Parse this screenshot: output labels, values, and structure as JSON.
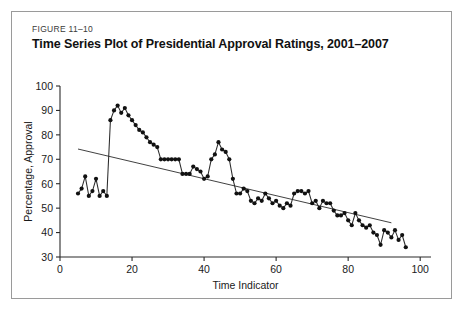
{
  "figure": {
    "number": "FIGURE 11–10",
    "title": "Time Series Plot of Presidential Approval Ratings, 2001–2007",
    "border_color": "#9a9a9a",
    "background_color": "#ffffff"
  },
  "chart_data": {
    "type": "line",
    "title": "Time Series Plot of Presidential Approval Ratings, 2001–2007",
    "xlabel": "Time Indicator",
    "ylabel": "Percentage, Approval",
    "xlim": [
      0,
      103
    ],
    "ylim": [
      30,
      100
    ],
    "xticks": [
      0,
      20,
      40,
      60,
      80,
      100
    ],
    "yticks": [
      30,
      40,
      50,
      60,
      70,
      80,
      90,
      100
    ],
    "grid": false,
    "legend": null,
    "marker": "filled-circle",
    "series": [
      {
        "name": "Presidential Approval Rating",
        "x": [
          5,
          6,
          7,
          8,
          9,
          10,
          11,
          12,
          13,
          14,
          15,
          16,
          17,
          18,
          19,
          20,
          21,
          22,
          23,
          24,
          25,
          26,
          27,
          28,
          29,
          30,
          31,
          32,
          33,
          34,
          35,
          36,
          37,
          38,
          39,
          40,
          41,
          42,
          43,
          44,
          45,
          46,
          47,
          48,
          49,
          50,
          51,
          52,
          53,
          54,
          55,
          56,
          57,
          58,
          59,
          60,
          61,
          62,
          63,
          64,
          65,
          66,
          67,
          68,
          69,
          70,
          71,
          72,
          73,
          74,
          75,
          76,
          77,
          78,
          79,
          80,
          81,
          82,
          83,
          84,
          85,
          86,
          87,
          88,
          89,
          90,
          91,
          92,
          93,
          94,
          95,
          96
        ],
        "values": [
          56,
          58,
          63,
          55,
          57,
          62,
          55,
          57,
          55,
          86,
          90,
          92,
          89,
          91,
          88,
          86,
          84,
          82,
          81,
          79,
          77,
          76,
          75,
          70,
          70,
          70,
          70,
          70,
          70,
          64,
          64,
          64,
          67,
          66,
          65,
          62,
          63,
          70,
          72,
          77,
          74,
          73,
          70,
          62,
          56,
          56,
          58,
          57,
          53,
          52,
          54,
          53,
          56,
          54,
          52,
          53,
          51,
          50,
          52,
          51,
          56,
          57,
          57,
          56,
          57,
          52,
          53,
          50,
          53,
          52,
          52,
          49,
          47,
          47,
          48,
          45,
          43,
          48,
          45,
          43,
          42,
          43,
          40,
          39,
          35,
          41,
          40,
          38,
          41,
          37,
          39,
          34
        ],
        "color": "#2b2b2b"
      }
    ],
    "trend_line": {
      "name": "Linear trend",
      "x": [
        5,
        92
      ],
      "values": [
        74.2,
        44.0
      ],
      "color": "#2b2b2b"
    },
    "annotations": []
  }
}
